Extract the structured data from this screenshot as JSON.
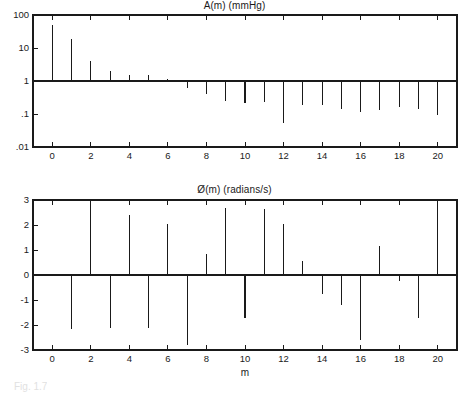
{
  "figure": {
    "caption": "Fig. 1.7",
    "xlabel": "m"
  },
  "chart_data": [
    {
      "type": "bar",
      "chart_style": "stem",
      "title": "A(m) (mmHg)",
      "xlabel": "",
      "ylabel": "",
      "yscale": "log",
      "ylim": [
        0.01,
        100
      ],
      "xlim": [
        -1,
        21
      ],
      "grid": false,
      "legend": null,
      "baseline": 1,
      "ytick_labels": [
        "100",
        "10",
        "1",
        ".1",
        ".01"
      ],
      "ytick_values": [
        100,
        10,
        1,
        0.1,
        0.01
      ],
      "xtick_labels": [
        "0",
        "2",
        "4",
        "6",
        "8",
        "10",
        "12",
        "14",
        "16",
        "18",
        "20"
      ],
      "xtick_values": [
        0,
        2,
        4,
        6,
        8,
        10,
        12,
        14,
        16,
        18,
        20
      ],
      "categories": [
        0,
        1,
        2,
        3,
        4,
        5,
        6,
        7,
        8,
        9,
        10,
        11,
        12,
        13,
        14,
        15,
        16,
        17,
        18,
        19,
        20
      ],
      "values": [
        50,
        19,
        4.1,
        2.0,
        1.5,
        1.55,
        1.15,
        0.62,
        0.41,
        0.24,
        0.21,
        0.23,
        0.052,
        0.19,
        0.19,
        0.145,
        0.115,
        0.13,
        0.16,
        0.145,
        0.095
      ]
    },
    {
      "type": "bar",
      "chart_style": "stem",
      "title": "Ø(m) (radians/s)",
      "xlabel": "m",
      "ylabel": "",
      "yscale": "linear",
      "ylim": [
        -3,
        3
      ],
      "xlim": [
        -1,
        21
      ],
      "grid": false,
      "legend": null,
      "baseline": 0,
      "ytick_labels": [
        "3",
        "2",
        "1",
        "0",
        "-1",
        "-2",
        "-3"
      ],
      "ytick_values": [
        3,
        2,
        1,
        0,
        -1,
        -2,
        -3
      ],
      "xtick_labels": [
        "0",
        "2",
        "4",
        "6",
        "8",
        "10",
        "12",
        "14",
        "16",
        "18",
        "20"
      ],
      "xtick_values": [
        0,
        2,
        4,
        6,
        8,
        10,
        12,
        14,
        16,
        18,
        20
      ],
      "categories": [
        0,
        1,
        2,
        3,
        4,
        5,
        6,
        7,
        8,
        9,
        10,
        11,
        12,
        13,
        14,
        15,
        16,
        17,
        18,
        19,
        20
      ],
      "values": [
        0,
        -2.15,
        3.0,
        -2.1,
        2.4,
        -2.1,
        2.05,
        -2.8,
        0.85,
        2.7,
        -1.7,
        2.65,
        2.05,
        0.55,
        -0.75,
        -1.2,
        -2.6,
        1.18,
        -0.25,
        -1.7,
        2.8
      ]
    }
  ]
}
